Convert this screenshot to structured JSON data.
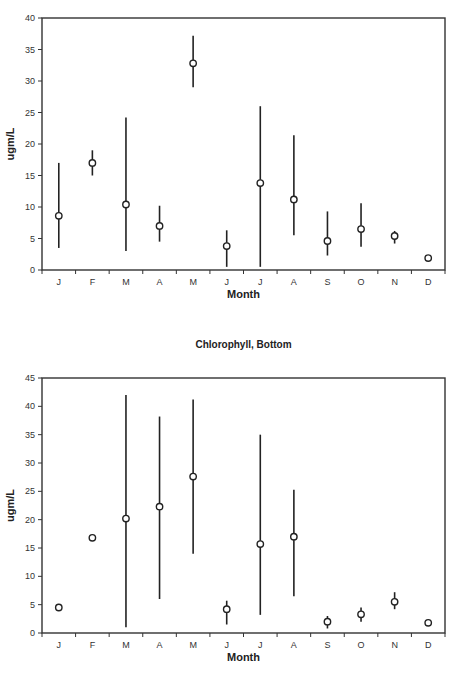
{
  "chart_data": [
    {
      "type": "scatter",
      "title": "",
      "xlabel": "Month",
      "ylabel": "ugm/L",
      "ylim": [
        0,
        40
      ],
      "yticks": [
        0,
        5,
        10,
        15,
        20,
        25,
        30,
        35,
        40
      ],
      "grid": false,
      "legend": null,
      "categories": [
        "J",
        "F",
        "M",
        "A",
        "M",
        "J",
        "J",
        "A",
        "S",
        "O",
        "N",
        "D"
      ],
      "series": [
        {
          "name": "mean",
          "values": [
            8.6,
            17.0,
            10.4,
            7.0,
            32.8,
            3.8,
            13.8,
            11.2,
            4.6,
            6.5,
            5.4,
            1.9
          ],
          "error_low": [
            3.5,
            15.0,
            3.0,
            4.5,
            29.0,
            0.5,
            0.5,
            5.5,
            2.3,
            3.7,
            4.2,
            null
          ],
          "error_high": [
            17.0,
            19.0,
            24.2,
            10.2,
            37.2,
            6.3,
            26.0,
            21.4,
            9.3,
            10.6,
            6.2,
            null
          ]
        }
      ]
    },
    {
      "type": "scatter",
      "title": "Chlorophyll, Bottom",
      "xlabel": "Month",
      "ylabel": "ugm/L",
      "ylim": [
        0,
        45
      ],
      "yticks": [
        0,
        5,
        10,
        15,
        20,
        25,
        30,
        35,
        40,
        45
      ],
      "grid": false,
      "legend": null,
      "categories": [
        "J",
        "F",
        "M",
        "A",
        "M",
        "J",
        "J",
        "A",
        "S",
        "O",
        "N",
        "D"
      ],
      "series": [
        {
          "name": "mean",
          "values": [
            4.5,
            16.8,
            20.2,
            22.3,
            27.6,
            4.2,
            15.7,
            17.0,
            2.0,
            3.3,
            5.5,
            1.8
          ],
          "error_low": [
            null,
            null,
            1.0,
            6.0,
            14.0,
            1.5,
            3.2,
            6.5,
            0.8,
            2.0,
            4.2,
            null
          ],
          "error_high": [
            null,
            null,
            42.0,
            38.2,
            41.2,
            5.7,
            35.0,
            25.3,
            3.0,
            4.5,
            7.2,
            null
          ]
        }
      ]
    }
  ],
  "charts": [
    {
      "title": "",
      "xlabel": "Month",
      "ylabel": "ugm/L"
    },
    {
      "title": "Chlorophyll, Bottom",
      "xlabel": "Month",
      "ylabel": "ugm/L"
    }
  ]
}
